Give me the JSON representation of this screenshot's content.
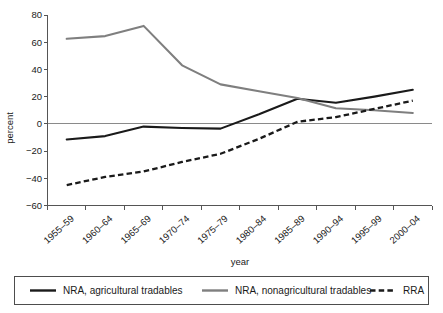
{
  "chart_data": {
    "type": "line",
    "title": "",
    "xlabel": "year",
    "ylabel": "percent",
    "categories": [
      "1955–59",
      "1960–64",
      "1965–69",
      "1970–74",
      "1975–79",
      "1980–84",
      "1985–89",
      "1990–94",
      "1995–99",
      "2000–04"
    ],
    "ylim": [
      -60,
      80
    ],
    "ytick_labels": [
      "80",
      "60",
      "40",
      "20",
      "0",
      "−20",
      "−40",
      "−60"
    ],
    "ytick_values": [
      80,
      60,
      40,
      20,
      0,
      -20,
      -40,
      -60
    ],
    "grid": false,
    "legend_position": "bottom",
    "series": [
      {
        "name": "NRA, agricultural tradables",
        "style": "solid",
        "color": "#1a1a1a",
        "values": [
          -11.5,
          -9,
          -2,
          -3,
          -3.5,
          7,
          18.5,
          15.5,
          20,
          25
        ]
      },
      {
        "name": "NRA, nonagricultural tradables",
        "style": "solid",
        "color": "#7f7f7f",
        "values": [
          62.5,
          64.5,
          72,
          43,
          29,
          24,
          19,
          11.5,
          10,
          8
        ]
      },
      {
        "name": "RRA",
        "style": "dashed",
        "color": "#1a1a1a",
        "values": [
          -45,
          -39,
          -35,
          -28,
          -22,
          -11,
          1.5,
          5,
          11,
          17
        ]
      }
    ]
  },
  "axes": {
    "y_title": "percent",
    "x_title": "year"
  },
  "legend": {
    "items": [
      {
        "label": "NRA, agricultural tradables"
      },
      {
        "label": "NRA, nonagricultural tradables"
      },
      {
        "label": "RRA"
      }
    ]
  }
}
